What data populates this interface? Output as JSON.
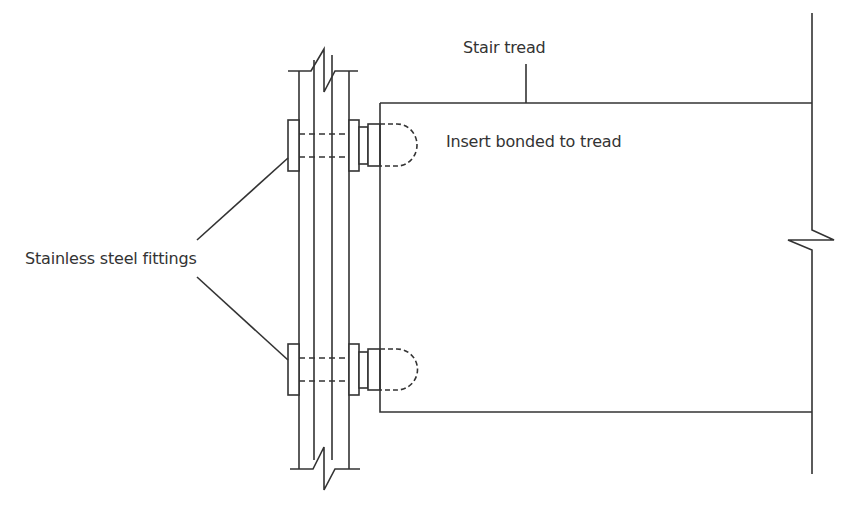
{
  "diagram": {
    "type": "technical-section-drawing",
    "labels": {
      "stair_tread": "Stair tread",
      "insert": "Insert bonded to tread",
      "fittings": "Stainless steel fittings"
    },
    "colors": {
      "line": "#333333",
      "background": "#ffffff"
    },
    "components": [
      {
        "name": "stringer-plates",
        "description": "Vertical plates with break lines at top and bottom"
      },
      {
        "name": "fitting-upper",
        "description": "Upper stainless steel fitting with bolt through plates"
      },
      {
        "name": "fitting-lower",
        "description": "Lower stainless steel fitting with bolt through plates"
      },
      {
        "name": "insert-upper",
        "description": "Dashed insert bonded into tread (upper)"
      },
      {
        "name": "insert-lower",
        "description": "Dashed insert bonded into tread (lower)"
      },
      {
        "name": "stair-tread",
        "description": "Tread outline with break line on right"
      }
    ]
  }
}
